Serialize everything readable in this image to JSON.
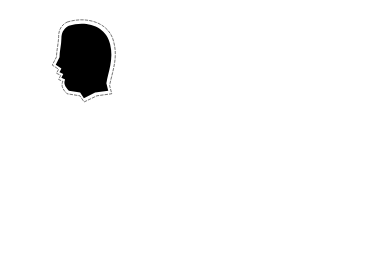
{
  "illustration": {
    "width": 391,
    "height": 270,
    "background": "#ffffff",
    "ink": "#111111",
    "featured_head": {
      "description": "black silhouette head with jagged arrow outline",
      "x": 52,
      "y": 22,
      "w": 60,
      "h": 78,
      "fill": "#000000"
    },
    "head_grid": {
      "description": "3x3 grid of outlined head profiles facing left",
      "cols": [
        15,
        65,
        117
      ],
      "rows": [
        103,
        157,
        210
      ],
      "w": 32,
      "h": 42
    },
    "flow_band": {
      "description": "thick black wavy band with dashed arrows above and below",
      "x0": 181,
      "x1": 380,
      "cy": 32,
      "thickness": 9,
      "amplitude": 3,
      "wavelength": 100,
      "arrow_rows": [
        18,
        45
      ]
    },
    "wave_ribbons": {
      "description": "double-line wavy ribbons with end ticks",
      "x0": 188,
      "x1": 372,
      "centers": [
        71,
        110,
        144,
        177,
        212,
        248
      ],
      "gap": 7,
      "amplitude": 3.5,
      "wavelength": 95
    }
  }
}
